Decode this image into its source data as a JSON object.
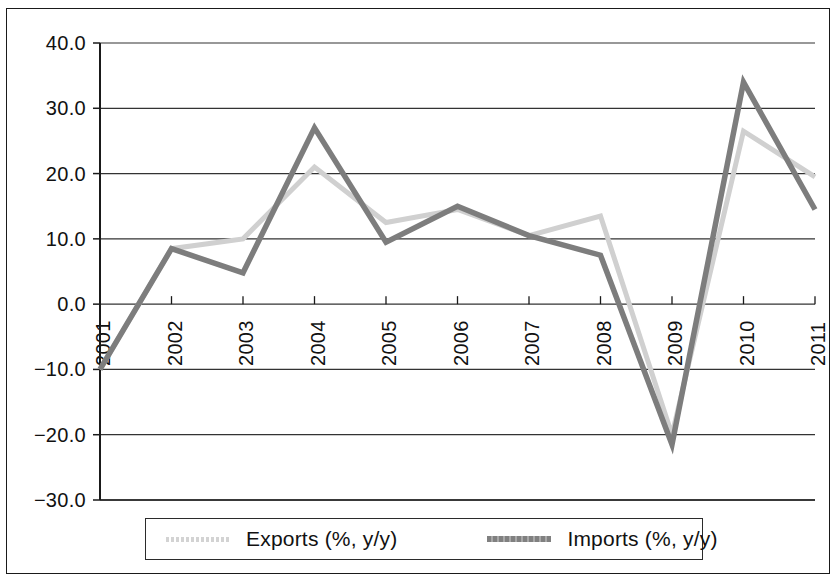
{
  "chart_data": {
    "type": "line",
    "title": "",
    "subtitle": "",
    "xlabel": "",
    "ylabel": "",
    "categories": [
      "2001",
      "2002",
      "2003",
      "2004",
      "2005",
      "2006",
      "2007",
      "2008",
      "2009",
      "2010",
      "2011"
    ],
    "xlim": [
      "2001",
      "2011"
    ],
    "ylim": [
      -30.0,
      40.0
    ],
    "ytick_labels": [
      "40.0",
      "30.0",
      "20.0",
      "10.0",
      "0.0",
      "−10.0",
      "−20.0",
      "−30.0"
    ],
    "ytick_values": [
      40.0,
      30.0,
      20.0,
      10.0,
      0.0,
      -10.0,
      -20.0,
      -30.0
    ],
    "grid": true,
    "grid_axis": "y",
    "legend_position": "bottom",
    "series": [
      {
        "name": "Exports (%, y/y)",
        "color": "#d0d0d0",
        "values": [
          -10.0,
          8.5,
          10.0,
          21.0,
          12.5,
          14.5,
          10.5,
          13.5,
          -20.0,
          26.5,
          19.5
        ]
      },
      {
        "name": "Imports (%, y/y)",
        "color": "#7d7d7d",
        "values": [
          -10.0,
          8.5,
          4.8,
          27.0,
          9.5,
          15.0,
          10.5,
          7.5,
          -21.5,
          34.0,
          14.5
        ]
      }
    ]
  },
  "legend": {
    "entries": [
      {
        "label": "Exports (%, y/y)",
        "swatch": "exports-line-swatch"
      },
      {
        "label": "Imports (%, y/y)",
        "swatch": "imports-line-swatch"
      }
    ]
  },
  "axes": {
    "y_labels": [
      "40.0",
      "30.0",
      "20.0",
      "10.0",
      "0.0",
      "−10.0",
      "−20.0",
      "−30.0"
    ],
    "x_labels": [
      "2001",
      "2002",
      "2003",
      "2004",
      "2005",
      "2006",
      "2007",
      "2008",
      "2009",
      "2010",
      "2011"
    ]
  },
  "colors": {
    "exports_line": "#d0d0d0",
    "imports_line": "#7d7d7d",
    "axis": "#1a1a1a",
    "grid": "#333333",
    "background": "#ffffff"
  }
}
